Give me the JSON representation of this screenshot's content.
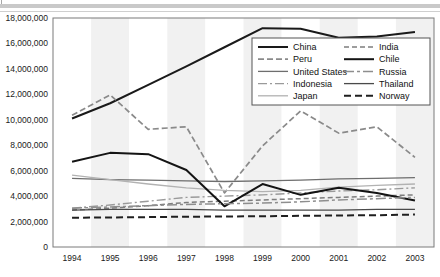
{
  "chart_data": {
    "type": "line",
    "title": "",
    "xlabel": "",
    "ylabel": "",
    "x": [
      1994,
      1995,
      1996,
      1997,
      1998,
      1999,
      2000,
      2001,
      2002,
      2003
    ],
    "categories": [
      "1994",
      "1995",
      "1996",
      "1997",
      "1998",
      "1999",
      "2000",
      "2001",
      "2002",
      "2003"
    ],
    "ylim": [
      0,
      18000000
    ],
    "ytick_step": 2000000,
    "yticks": [
      0,
      2000000,
      4000000,
      6000000,
      8000000,
      10000000,
      12000000,
      14000000,
      16000000,
      18000000
    ],
    "ytick_labels": [
      "0",
      "2,000,000",
      "4,000,000",
      "6,000,000",
      "8,000,000",
      "10,000,000",
      "12,000,000",
      "14,000,000",
      "16,000,000",
      "18,000,000"
    ],
    "grid": false,
    "background_bands": true,
    "legend_position": "upper-right-inside",
    "legend_columns": 2,
    "series": [
      {
        "name": "China",
        "style": "solid",
        "width": 2.0,
        "color": "#1a1a1a",
        "dash": "",
        "values": [
          10100000,
          11300000,
          12750000,
          14200000,
          15700000,
          17200000,
          17150000,
          16450000,
          16550000,
          16900000
        ]
      },
      {
        "name": "Peru",
        "style": "dashed",
        "width": 1.7,
        "color": "#8a8a8a",
        "dash": "6,3",
        "values": [
          10350000,
          11950000,
          9250000,
          9450000,
          4250000,
          7950000,
          10700000,
          8950000,
          9450000,
          7050000
        ]
      },
      {
        "name": "United States",
        "style": "solid",
        "width": 1.3,
        "color": "#6e6e6e",
        "dash": "",
        "values": [
          5400000,
          5300000,
          5250000,
          5200000,
          5150000,
          5200000,
          5250000,
          5350000,
          5400000,
          5450000
        ]
      },
      {
        "name": "Indonesia",
        "style": "dash-dot",
        "width": 1.4,
        "color": "#9a9a9a",
        "dash": "9,3,2,3",
        "values": [
          3050000,
          3300000,
          3600000,
          3900000,
          4000000,
          4100000,
          4250000,
          4400000,
          4500000,
          4650000
        ]
      },
      {
        "name": "Japan",
        "style": "solid",
        "width": 1.3,
        "color": "#b2b2b2",
        "dash": "",
        "values": [
          5650000,
          5300000,
          4950000,
          4650000,
          4450000,
          4350000,
          4450000,
          4700000,
          4850000,
          4950000
        ]
      },
      {
        "name": "India",
        "style": "dashed",
        "width": 1.5,
        "color": "#7d7d7d",
        "dash": "5,3",
        "values": [
          2900000,
          3050000,
          3250000,
          3500000,
          3600000,
          3700000,
          3800000,
          3900000,
          4000000,
          4100000
        ]
      },
      {
        "name": "Chile",
        "style": "solid",
        "width": 2.0,
        "color": "#141414",
        "dash": "",
        "values": [
          6700000,
          7400000,
          7300000,
          6050000,
          3200000,
          4950000,
          4100000,
          4650000,
          4250000,
          3650000
        ]
      },
      {
        "name": "Russia",
        "style": "dash-dot",
        "width": 1.5,
        "color": "#8e8e8e",
        "dash": "10,3,3,3",
        "values": [
          3050000,
          3150000,
          3250000,
          3350000,
          3400000,
          3450000,
          3550000,
          3700000,
          3800000,
          3900000
        ]
      },
      {
        "name": "Thailand",
        "style": "solid",
        "width": 1.3,
        "color": "#4a4a4a",
        "dash": "",
        "values": [
          2900000,
          2950000,
          2950000,
          2950000,
          2900000,
          2900000,
          2900000,
          2900000,
          2950000,
          2950000
        ]
      },
      {
        "name": "Norway",
        "style": "dashed",
        "width": 2.0,
        "color": "#1f1f1f",
        "dash": "7,4",
        "values": [
          2300000,
          2320000,
          2350000,
          2380000,
          2400000,
          2420000,
          2450000,
          2480000,
          2500000,
          2550000
        ]
      }
    ]
  },
  "legend": {
    "column_left": [
      "China",
      "Peru",
      "United States",
      "Indonesia",
      "Japan"
    ],
    "column_right": [
      "India",
      "Chile",
      "Russia",
      "Thailand",
      "Norway"
    ]
  },
  "colors": {
    "plot_border": "#7a7a7a",
    "band_light": "#ffffff",
    "band_shade": "#f1f1f1",
    "axis_text": "#1a1a1a",
    "legend_border": "#555555",
    "legend_bg": "#ffffff",
    "top_band": "#c9c9c9"
  }
}
